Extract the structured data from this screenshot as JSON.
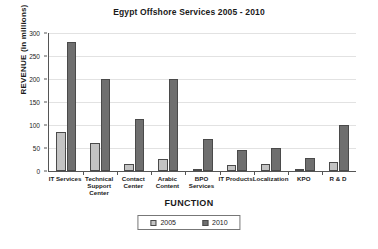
{
  "chart_data": {
    "type": "bar",
    "title": "Egypt Offshore Services 2005 - 2010",
    "xlabel": "FUNCTION",
    "ylabel": "REVENUE (in millions)",
    "ylim": [
      0,
      300
    ],
    "yticks": [
      0,
      50,
      100,
      150,
      200,
      250,
      300
    ],
    "grid": true,
    "legend_position": "bottom",
    "categories": [
      "IT Services",
      "Technical Support Center",
      "Contact Center",
      "Arabic Content",
      "BPO Services",
      "IT Products",
      "Localization",
      "KPO",
      "R & D"
    ],
    "series": [
      {
        "name": "2005",
        "color": "#c3c3c3",
        "values": [
          85,
          60,
          15,
          27,
          5,
          14,
          16,
          3,
          19
        ]
      },
      {
        "name": "2010",
        "color": "#6f6f6f",
        "values": [
          280,
          200,
          112,
          200,
          70,
          45,
          50,
          28,
          100
        ]
      }
    ]
  }
}
